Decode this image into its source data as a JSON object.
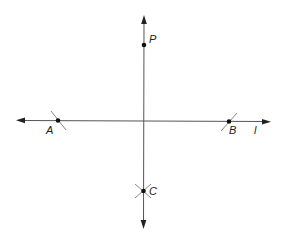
{
  "diagram": {
    "type": "geometric-construction",
    "line_color": "#555555",
    "point_color": "#111111",
    "line_l": {
      "label": "l",
      "y": 121,
      "x1": 16,
      "x2": 270
    },
    "perpendicular": {
      "x": 144,
      "y1": 15,
      "y2": 228
    },
    "points": [
      {
        "id": "P",
        "label": "P",
        "x": 144,
        "y": 45
      },
      {
        "id": "A",
        "label": "A",
        "x": 58,
        "y": 120
      },
      {
        "id": "B",
        "label": "B",
        "x": 229,
        "y": 121
      },
      {
        "id": "C",
        "label": "C",
        "x": 143,
        "y": 191
      }
    ]
  }
}
